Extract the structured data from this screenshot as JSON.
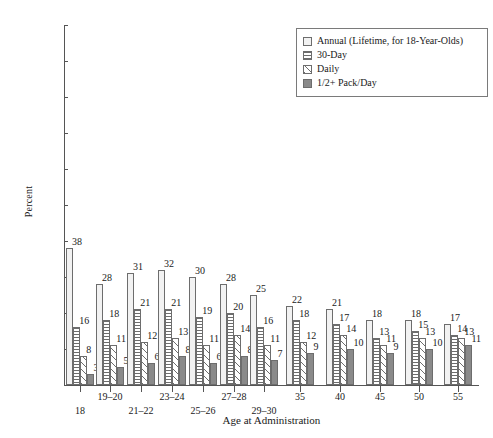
{
  "chart_data": {
    "type": "bar",
    "title": "",
    "xlabel": "Age at Administration",
    "ylabel": "Percent",
    "ylim": [
      0,
      100
    ],
    "ytick_step": 10,
    "yticks": [
      0,
      10,
      20,
      30,
      40,
      50,
      60,
      70,
      80,
      90,
      100
    ],
    "grid": false,
    "legend_position": "top-right",
    "categories": [
      "18",
      "19–20",
      "21–22",
      "23–24",
      "25–26",
      "27–28",
      "29–30",
      "35",
      "40",
      "45",
      "50",
      "55"
    ],
    "series": [
      {
        "name": "Annual (Lifetime, for 18-Year-Olds)",
        "pattern": "solid-light",
        "color": "#f2f2f2",
        "values": [
          38,
          28,
          31,
          32,
          30,
          28,
          25,
          22,
          21,
          18,
          18,
          17
        ]
      },
      {
        "name": "30-Day",
        "pattern": "horizontal-lines",
        "color": "#6d6d6d",
        "values": [
          16,
          18,
          21,
          21,
          19,
          20,
          16,
          18,
          17,
          13,
          15,
          14
        ]
      },
      {
        "name": "Daily",
        "pattern": "diagonal-hatch",
        "color": "#6d6d6d",
        "values": [
          8,
          11,
          12,
          13,
          11,
          14,
          11,
          12,
          14,
          11,
          13,
          13
        ]
      },
      {
        "name": "1/2+ Pack/Day",
        "pattern": "solid-dark",
        "color": "#8a8a8a",
        "values": [
          3,
          5,
          6,
          8,
          6,
          8,
          7,
          9,
          10,
          9,
          10,
          11
        ]
      }
    ]
  },
  "legend": {
    "items": [
      {
        "label": "Annual (Lifetime, for 18-Year-Olds)"
      },
      {
        "label": "30-Day"
      },
      {
        "label": "Daily"
      },
      {
        "label": "1/2+ Pack/Day"
      }
    ]
  },
  "axes": {
    "y_title": "Percent",
    "x_title": "Age at Administration",
    "y_tick_labels": [
      "100",
      "90",
      "80",
      "70",
      "60",
      "50",
      "40",
      "30",
      "20",
      "10",
      "0"
    ],
    "x_tick_labels": [
      "18",
      "19–20",
      "21–22",
      "23–24",
      "25–26",
      "27–28",
      "29–30",
      "35",
      "40",
      "45",
      "50",
      "55"
    ]
  }
}
